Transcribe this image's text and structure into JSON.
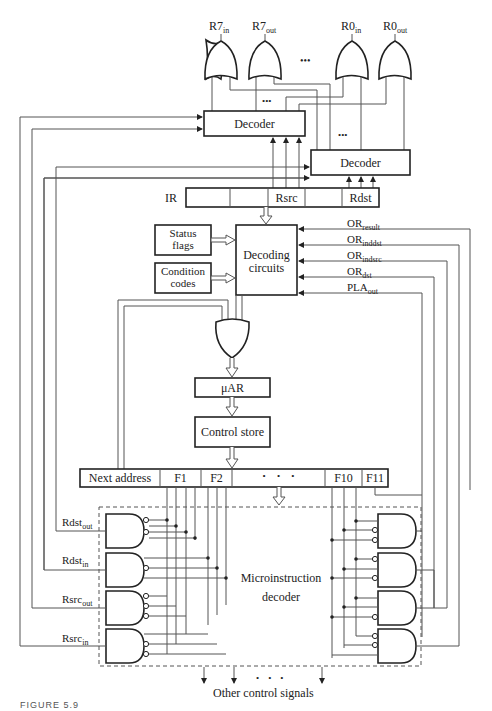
{
  "figure": {
    "caption": "FIGURE 5.9"
  },
  "register_gates": {
    "outputs": [
      {
        "base": "R7",
        "sub": "in"
      },
      {
        "base": "R7",
        "sub": "out"
      },
      {
        "base": "R0",
        "sub": "in"
      },
      {
        "base": "R0",
        "sub": "out"
      }
    ],
    "ellipsis": "•••"
  },
  "decoders": {
    "upper": "Decoder",
    "lower": "Decoder",
    "ellipsis_upper": "•••",
    "ellipsis_lower": "•••"
  },
  "ir": {
    "label": "IR",
    "fields": [
      "",
      "",
      "Rsrc",
      "",
      "Rdst"
    ]
  },
  "inputs": {
    "status_flags": [
      "Status",
      "flags"
    ],
    "condition_codes": [
      "Condition",
      "codes"
    ]
  },
  "decoding_circuits": [
    "Decoding",
    "circuits"
  ],
  "decoding_inputs": [
    {
      "base": "OR",
      "sub": "result"
    },
    {
      "base": "OR",
      "sub": "inddst"
    },
    {
      "base": "OR",
      "sub": "indsrc"
    },
    {
      "base": "OR",
      "sub": "dst"
    },
    {
      "base": "PLA",
      "sub": "out"
    }
  ],
  "micro_pipeline": {
    "uar": "μAR",
    "control_store": "Control store"
  },
  "microinstruction": {
    "fields": [
      "Next address",
      "F1",
      "F2",
      "•     •     •",
      "F10",
      "F11"
    ]
  },
  "microinstruction_decoder": {
    "label": [
      "Microinstruction",
      "decoder"
    ],
    "left_outputs": [
      {
        "base": "Rdst",
        "sub": "out"
      },
      {
        "base": "Rdst",
        "sub": "in"
      },
      {
        "base": "Rsrc",
        "sub": "out"
      },
      {
        "base": "Rsrc",
        "sub": "in"
      }
    ]
  },
  "other_signals": {
    "label": "Other control signals",
    "ellipsis": "•    •    •"
  }
}
